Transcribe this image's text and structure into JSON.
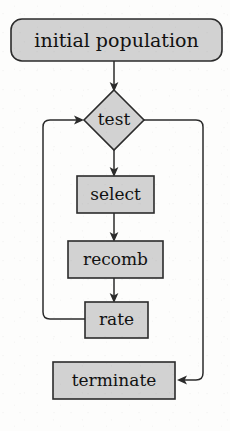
{
  "diagram": {
    "type": "flowchart",
    "style": {
      "node_fill": "#d2d2d2",
      "node_stroke": "#2b2b2b",
      "edge_stroke": "#2b2b2b",
      "background": "#fdfdfc",
      "text_color": "#111111"
    },
    "nodes": [
      {
        "id": "initial-population",
        "label": "initial population",
        "shape": "rounded-rectangle",
        "x": 11,
        "y": 19,
        "w": 211,
        "h": 42,
        "font_size": 19
      },
      {
        "id": "test",
        "label": "test",
        "shape": "diamond",
        "cx": 114,
        "cy": 120,
        "w": 60,
        "h": 60,
        "font_size": 17
      },
      {
        "id": "select",
        "label": "select",
        "shape": "rectangle",
        "x": 77,
        "y": 176,
        "w": 77,
        "h": 37,
        "font_size": 17
      },
      {
        "id": "recomb",
        "label": "recomb",
        "shape": "rectangle",
        "x": 68,
        "y": 241,
        "w": 95,
        "h": 37,
        "font_size": 17
      },
      {
        "id": "rate",
        "label": "rate",
        "shape": "rectangle",
        "x": 85,
        "y": 302,
        "w": 63,
        "h": 36,
        "font_size": 17
      },
      {
        "id": "terminate",
        "label": "terminate",
        "shape": "rectangle",
        "x": 53,
        "y": 362,
        "w": 122,
        "h": 37,
        "font_size": 17
      }
    ],
    "edges": [
      {
        "id": "edge-initial-to-test",
        "from": "initial-population",
        "to": "test",
        "arrow": "down"
      },
      {
        "id": "edge-test-to-select",
        "from": "test",
        "to": "select",
        "arrow": "down"
      },
      {
        "id": "edge-select-to-recomb",
        "from": "select",
        "to": "recomb",
        "arrow": "down"
      },
      {
        "id": "edge-recomb-to-rate",
        "from": "recomb",
        "to": "rate",
        "arrow": "down"
      },
      {
        "id": "edge-rate-to-test",
        "from": "rate",
        "to": "test",
        "arrow": "right",
        "routing": "loop-left"
      },
      {
        "id": "edge-test-to-terminate",
        "from": "test",
        "to": "terminate",
        "arrow": "left",
        "routing": "loop-right"
      }
    ]
  }
}
